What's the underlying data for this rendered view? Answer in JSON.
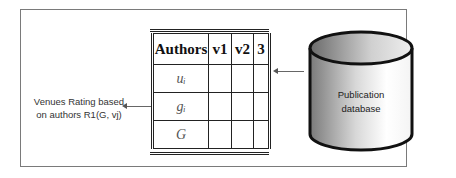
{
  "diagram": {
    "label": {
      "line1": "Venues Rating based",
      "line2": "on authors R1(G, vj)"
    },
    "table": {
      "headers": [
        "Authors",
        "v1",
        "v2",
        "3"
      ],
      "rows": [
        {
          "author": "uᵢ",
          "cells": [
            "",
            "",
            ""
          ]
        },
        {
          "author": "gᵢ",
          "cells": [
            "",
            "",
            ""
          ]
        },
        {
          "author": "G",
          "cells": [
            "",
            "",
            ""
          ]
        }
      ]
    },
    "database": {
      "line1": "Publication",
      "line2": "database"
    },
    "colors": {
      "stroke": "#222222",
      "frame": "#7a7a7a",
      "db_light": "#ffffff",
      "db_dark": "#6e6e6e"
    }
  }
}
